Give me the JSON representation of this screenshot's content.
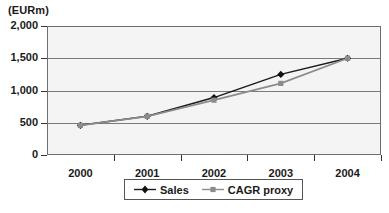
{
  "chart_data": {
    "type": "line",
    "title": "",
    "subtitle": "",
    "xlabel": "",
    "ylabel": "(EURm)",
    "unit_label": "(EURm)",
    "categories": [
      "2000",
      "2001",
      "2002",
      "2003",
      "2004"
    ],
    "x": [
      2000,
      2001,
      2002,
      2003,
      2004
    ],
    "series": [
      {
        "name": "Sales",
        "values": [
          460,
          600,
          890,
          1250,
          1500
        ],
        "color": "#1a1a1a",
        "marker": "diamond"
      },
      {
        "name": "CAGR proxy",
        "values": [
          460,
          600,
          850,
          1110,
          1500
        ],
        "color": "#8c8c8c",
        "marker": "square"
      }
    ],
    "ylim": [
      0,
      2000
    ],
    "y_ticks": [
      0,
      500,
      1000,
      1500,
      2000
    ],
    "y_tick_labels": [
      "0",
      "500",
      "1,000",
      "1,500",
      "2,000"
    ],
    "x_tick_labels": [
      "2000",
      "2001",
      "2002",
      "2003",
      "2004"
    ],
    "grid": true,
    "grid_axis": "y",
    "legend_position": "bottom",
    "plot_background": "#f4f4f4",
    "frame_color": "#6e6e6e"
  },
  "legend": {
    "entries": [
      {
        "label": "Sales",
        "key_icon": "diamond-marker-icon"
      },
      {
        "label": "CAGR proxy",
        "key_icon": "square-marker-icon"
      }
    ]
  }
}
